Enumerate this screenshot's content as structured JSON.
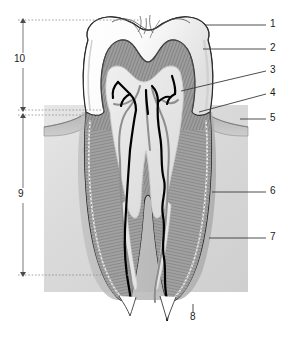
{
  "figure": {
    "type": "anatomical-diagram",
    "background_color": "#ffffff",
    "canvas": {
      "width": 296,
      "height": 338
    }
  },
  "colors": {
    "outline": "#1a1a1a",
    "enamel": "#fdfdfd",
    "enamel_shadow": "#e2e2e2",
    "dentin": "#9a9a9a",
    "dentin_dark": "#7e7e7e",
    "pulp": "#e8e8e8",
    "bone": "#d6d6d6",
    "bone_light": "#e4e4e4",
    "gingiva": "#b4b4b4",
    "nerve": "#000000",
    "vessel": "#8e8e8e",
    "leader_line": "#3a3a3a",
    "dimension_line": "#6a6a6a",
    "dashed_guide": "#8a8a8a"
  },
  "callouts": [
    {
      "id": "1",
      "label": "1",
      "x": 272,
      "y": 21,
      "anchor_x": 205,
      "anchor_y": 28,
      "leader": "straight"
    },
    {
      "id": "2",
      "label": "2",
      "x": 272,
      "y": 45,
      "anchor_x": 203,
      "anchor_y": 49,
      "leader": "straight"
    },
    {
      "id": "3",
      "label": "3",
      "x": 272,
      "y": 68,
      "anchor_x": 182,
      "anchor_y": 90,
      "leader": "diagonal"
    },
    {
      "id": "4",
      "label": "4",
      "x": 272,
      "y": 90,
      "anchor_x": 200,
      "anchor_y": 110,
      "leader": "diagonal"
    },
    {
      "id": "5",
      "label": "5",
      "x": 272,
      "y": 116,
      "anchor_x": 243,
      "anchor_y": 117,
      "leader": "straight"
    },
    {
      "id": "6",
      "label": "6",
      "x": 272,
      "y": 189,
      "anchor_x": 213,
      "anchor_y": 189,
      "leader": "straight"
    },
    {
      "id": "7",
      "label": "7",
      "x": 272,
      "y": 235,
      "anchor_x": 210,
      "anchor_y": 235,
      "leader": "straight"
    },
    {
      "id": "8",
      "label": "8",
      "x": 190,
      "y": 313,
      "anchor_x": 193,
      "anchor_y": 300,
      "leader": "vertical"
    }
  ],
  "dimensions": [
    {
      "id": "10",
      "label": "10",
      "x": 16,
      "y": 60,
      "line_x": 23,
      "top": 20,
      "bottom": 110
    },
    {
      "id": "9",
      "label": "9",
      "x": 17,
      "y": 196,
      "line_x": 23,
      "top": 115,
      "bottom": 275
    }
  ],
  "guides": [
    {
      "name": "crown-top-guide",
      "y": 20,
      "x1": 18,
      "x2": 140
    },
    {
      "name": "gumline-guide",
      "y": 110,
      "x1": 18,
      "x2": 105
    },
    {
      "name": "bone-base-guide",
      "y": 275,
      "x1": 18,
      "x2": 130
    }
  ],
  "regions": {
    "bone_box": {
      "x": 44,
      "y": 105,
      "width": 204,
      "height": 187
    },
    "crown": {
      "top": 15,
      "bottom": 112
    },
    "root": {
      "top": 112,
      "bottom": 300
    }
  }
}
